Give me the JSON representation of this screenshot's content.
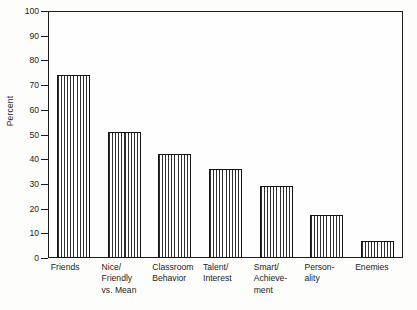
{
  "chart_data": {
    "type": "bar",
    "title": "",
    "xlabel": "",
    "ylabel": "Percent",
    "ylim": [
      0,
      100
    ],
    "ytick_step": 10,
    "yticks": [
      0,
      10,
      20,
      30,
      40,
      50,
      60,
      70,
      80,
      90,
      100
    ],
    "grid": false,
    "legend": false,
    "orientation": "vertical",
    "bar_fill": "vertical-line-hatch",
    "bar_edge_color": "#141414",
    "frame": "box",
    "categories": [
      "Friends",
      "Nice/\nFriendly\nvs. Mean",
      "Classroom\nBehavior",
      "Talent/\nInterest",
      "Smart/\nAchieve-\nment",
      "Person-\nality",
      "Enemies"
    ],
    "values": [
      74,
      51,
      42,
      36,
      29,
      17.5,
      7
    ]
  },
  "axis": {
    "y_title": "Percent",
    "tick_labels": [
      "100",
      "90",
      "80",
      "70",
      "60",
      "50",
      "40",
      "30",
      "20",
      "10",
      "0"
    ]
  }
}
